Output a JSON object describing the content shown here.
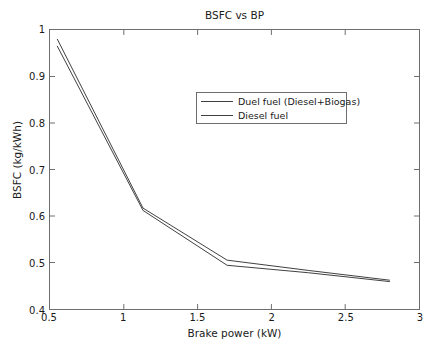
{
  "figure": {
    "top_fragment": "",
    "background_color": "#ffffff",
    "frame_color": "#6e6e6e"
  },
  "chart_data": {
    "type": "line",
    "title": "BSFC vs BP",
    "xlabel": "Brake power (kW)",
    "ylabel": "BSFC (kg/kWh)",
    "xlim": [
      0.5,
      3
    ],
    "ylim": [
      0.4,
      1
    ],
    "grid": false,
    "legend_position": "upper-center",
    "xticks": [
      0.5,
      1,
      1.5,
      2,
      2.5,
      3
    ],
    "xtick_labels": [
      "0.5",
      "1",
      "1.5",
      "2",
      "2.5",
      "3"
    ],
    "yticks": [
      0.4,
      0.5,
      0.6,
      0.7,
      0.8,
      0.9,
      1
    ],
    "ytick_labels": [
      "0.4",
      "0.5",
      "0.6",
      "0.7",
      "0.8",
      "0.9",
      "1"
    ],
    "series": [
      {
        "name": "Duel fuel (Diesel+Biogas)",
        "color": "#3f3f3f",
        "x": [
          0.55,
          1.13,
          1.7,
          2.25,
          2.8
        ],
        "y": [
          0.98,
          0.617,
          0.505,
          0.483,
          0.462
        ]
      },
      {
        "name": "Diesel fuel",
        "color": "#3f3f3f",
        "x": [
          0.55,
          1.13,
          1.7,
          2.25,
          2.8
        ],
        "y": [
          0.965,
          0.612,
          0.494,
          0.478,
          0.459
        ]
      }
    ]
  },
  "legend": {
    "entries": [
      {
        "label": "Duel fuel (Diesel+Biogas)",
        "color": "#3f3f3f"
      },
      {
        "label": "Diesel fuel",
        "color": "#3f3f3f"
      }
    ]
  }
}
